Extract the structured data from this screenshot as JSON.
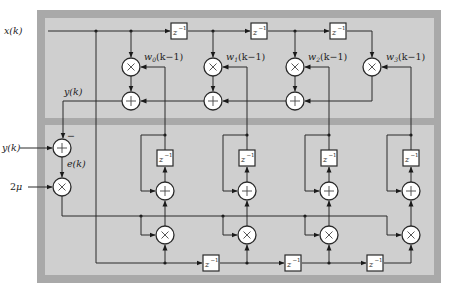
{
  "diagram": {
    "colors": {
      "outer_frame": "#a9a9a9",
      "inner_panel": "#cfcfcf",
      "divider": "#a9a9a9",
      "wire": "#2a2a2a",
      "node_fill": "#ffffff"
    },
    "inputs": {
      "x": "x(k)",
      "y_desired": "y(k)",
      "step": "2μ"
    },
    "labels": {
      "y_output": "y(k)",
      "error": "e(k)",
      "minus_sign": "−"
    },
    "delay": {
      "z": "z",
      "exp": "−1"
    },
    "weights": [
      {
        "name": "w",
        "sub": "0",
        "arg": "(k−1)"
      },
      {
        "name": "w",
        "sub": "1",
        "arg": "(k−1)"
      },
      {
        "name": "w",
        "sub": "2",
        "arg": "(k−1)"
      },
      {
        "name": "w",
        "sub": "3",
        "arg": "(k−1)"
      }
    ],
    "sections": [
      "filter",
      "weight-update"
    ]
  }
}
